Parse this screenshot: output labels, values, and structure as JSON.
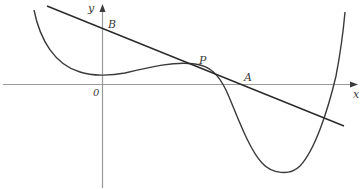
{
  "figure": {
    "labels": {
      "y_axis": "y",
      "x_axis": "x",
      "origin": "0",
      "point_b": "B",
      "point_p": "P",
      "point_a": "A"
    },
    "colors": {
      "axis": "#999999",
      "curve": "#3a3a3a",
      "line": "#2a2a2a",
      "text": "#3a3a3a"
    }
  }
}
